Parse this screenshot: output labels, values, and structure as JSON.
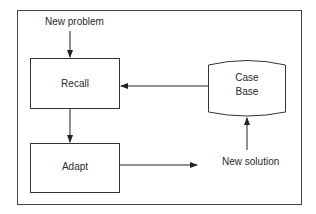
{
  "diagram": {
    "type": "flowchart",
    "title": "",
    "nodes": [
      {
        "id": "recall",
        "label": "Recall",
        "shape": "rectangle"
      },
      {
        "id": "adapt",
        "label": "Adapt",
        "shape": "rectangle"
      },
      {
        "id": "case_base",
        "label_line1": "Case",
        "label_line2": "Base",
        "shape": "cylinder"
      }
    ],
    "labels": {
      "new_problem": "New problem",
      "new_solution": "New solution"
    },
    "edges": [
      {
        "from": "new_problem",
        "to": "recall"
      },
      {
        "from": "case_base",
        "to": "recall"
      },
      {
        "from": "recall",
        "to": "adapt"
      },
      {
        "from": "adapt",
        "to": "output"
      },
      {
        "from": "new_solution",
        "to": "case_base"
      }
    ],
    "colors": {
      "stroke": "#333333",
      "background": "#ffffff",
      "text": "#2a2a2a"
    }
  }
}
